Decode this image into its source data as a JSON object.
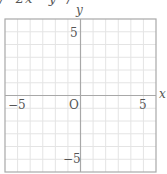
{
  "top_fragment": "/  2x   y  /",
  "chart_data": {
    "type": "line",
    "title": "",
    "xlabel": "x",
    "ylabel": "y",
    "xlim": [
      -6,
      6
    ],
    "ylim": [
      -6,
      6
    ],
    "grid": true,
    "grid_step": 1,
    "series": [],
    "x_tick_labels": [
      "-5",
      "O",
      "5"
    ],
    "y_tick_labels": [
      "5",
      "-5"
    ],
    "origin_label": "O"
  },
  "labels": {
    "x_axis": "x",
    "y_axis": "y",
    "x_neg5": "−5",
    "x_pos5": "5",
    "origin": "O",
    "y_pos5": "5",
    "y_neg5": "−5"
  },
  "colors": {
    "grid": "#e4e4e4",
    "axis": "#a8a8a8",
    "frame": "#a8a8a8",
    "text": "#555555"
  }
}
